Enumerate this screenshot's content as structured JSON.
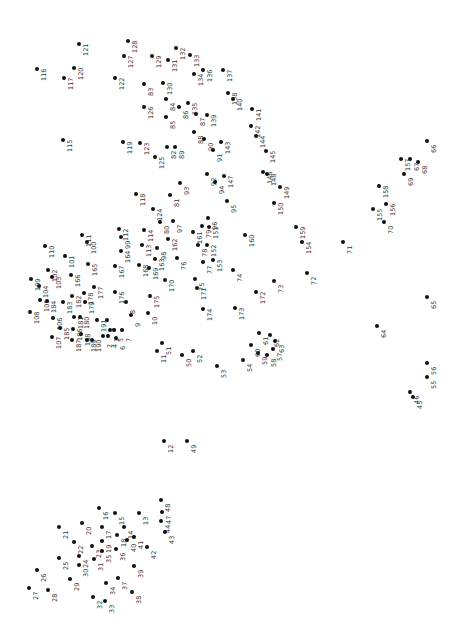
{
  "puzzle": {
    "type": "connect-the-dots",
    "orientation": "rotated-90",
    "dot_color": "#111111",
    "label_color": "#333333",
    "dots": [
      {
        "n": "1",
        "x": 110,
        "y": 330
      },
      {
        "n": "2",
        "x": 103,
        "y": 336
      },
      {
        "n": "3",
        "x": 107,
        "y": 320
      },
      {
        "n": "4",
        "x": 108,
        "y": 336
      },
      {
        "n": "5",
        "x": 114,
        "y": 330
      },
      {
        "n": "6",
        "x": 116,
        "y": 338
      },
      {
        "n": "7",
        "x": 122,
        "y": 330
      },
      {
        "n": "8",
        "x": 126,
        "y": 302
      },
      {
        "n": "9",
        "x": 131,
        "y": 315
      },
      {
        "n": "10",
        "x": 148,
        "y": 313
      },
      {
        "n": "11",
        "x": 157,
        "y": 351
      },
      {
        "n": "12",
        "x": 164,
        "y": 441
      },
      {
        "n": "13",
        "x": 139,
        "y": 513
      },
      {
        "n": "14",
        "x": 124,
        "y": 527
      },
      {
        "n": "15",
        "x": 115,
        "y": 513
      },
      {
        "n": "16",
        "x": 99,
        "y": 508
      },
      {
        "n": "17",
        "x": 102,
        "y": 527
      },
      {
        "n": "18",
        "x": 117,
        "y": 535
      },
      {
        "n": "19",
        "x": 102,
        "y": 541
      },
      {
        "n": "20",
        "x": 82,
        "y": 523
      },
      {
        "n": "21",
        "x": 59,
        "y": 527
      },
      {
        "n": "22",
        "x": 74,
        "y": 542
      },
      {
        "n": "23",
        "x": 92,
        "y": 546
      },
      {
        "n": "24",
        "x": 79,
        "y": 556
      },
      {
        "n": "25",
        "x": 59,
        "y": 558
      },
      {
        "n": "26",
        "x": 37,
        "y": 570
      },
      {
        "n": "27",
        "x": 29,
        "y": 588
      },
      {
        "n": "28",
        "x": 48,
        "y": 590
      },
      {
        "n": "29",
        "x": 70,
        "y": 579
      },
      {
        "n": "30",
        "x": 79,
        "y": 565
      },
      {
        "n": "31",
        "x": 94,
        "y": 559
      },
      {
        "n": "32",
        "x": 93,
        "y": 597
      },
      {
        "n": "33",
        "x": 105,
        "y": 601
      },
      {
        "n": "34",
        "x": 106,
        "y": 583
      },
      {
        "n": "35",
        "x": 102,
        "y": 551
      },
      {
        "n": "36",
        "x": 116,
        "y": 549
      },
      {
        "n": "37",
        "x": 118,
        "y": 578
      },
      {
        "n": "38",
        "x": 132,
        "y": 592
      },
      {
        "n": "39",
        "x": 134,
        "y": 566
      },
      {
        "n": "40",
        "x": 127,
        "y": 540
      },
      {
        "n": "41",
        "x": 134,
        "y": 537
      },
      {
        "n": "42",
        "x": 147,
        "y": 547
      },
      {
        "n": "43",
        "x": 165,
        "y": 532
      },
      {
        "n": "44",
        "x": 161,
        "y": 521
      },
      {
        "n": "45",
        "x": 413,
        "y": 397
      },
      {
        "n": "46",
        "x": 410,
        "y": 392
      },
      {
        "n": "47",
        "x": 162,
        "y": 512
      },
      {
        "n": "48",
        "x": 161,
        "y": 500
      },
      {
        "n": "49",
        "x": 187,
        "y": 441
      },
      {
        "n": "50",
        "x": 182,
        "y": 355
      },
      {
        "n": "51",
        "x": 162,
        "y": 343
      },
      {
        "n": "52",
        "x": 193,
        "y": 351
      },
      {
        "n": "53",
        "x": 217,
        "y": 366
      },
      {
        "n": "54",
        "x": 243,
        "y": 360
      },
      {
        "n": "55",
        "x": 427,
        "y": 377
      },
      {
        "n": "56",
        "x": 427,
        "y": 363
      },
      {
        "n": "57",
        "x": 273,
        "y": 349
      },
      {
        "n": "58",
        "x": 267,
        "y": 355
      },
      {
        "n": "59",
        "x": 258,
        "y": 353
      },
      {
        "n": "60",
        "x": 251,
        "y": 345
      },
      {
        "n": "61",
        "x": 259,
        "y": 333
      },
      {
        "n": "62",
        "x": 270,
        "y": 335
      },
      {
        "n": "63",
        "x": 275,
        "y": 341
      },
      {
        "n": "64",
        "x": 377,
        "y": 326
      },
      {
        "n": "65",
        "x": 427,
        "y": 297
      },
      {
        "n": "66",
        "x": 427,
        "y": 141
      },
      {
        "n": "67",
        "x": 410,
        "y": 159
      },
      {
        "n": "68",
        "x": 418,
        "y": 162
      },
      {
        "n": "69",
        "x": 404,
        "y": 174
      },
      {
        "n": "70",
        "x": 384,
        "y": 222
      },
      {
        "n": "71",
        "x": 343,
        "y": 242
      },
      {
        "n": "72",
        "x": 307,
        "y": 273
      },
      {
        "n": "73",
        "x": 274,
        "y": 281
      },
      {
        "n": "74",
        "x": 233,
        "y": 270
      },
      {
        "n": "75",
        "x": 195,
        "y": 279
      },
      {
        "n": "76",
        "x": 177,
        "y": 258
      },
      {
        "n": "77",
        "x": 203,
        "y": 262
      },
      {
        "n": "78",
        "x": 198,
        "y": 245
      },
      {
        "n": "79",
        "x": 202,
        "y": 226
      },
      {
        "n": "80",
        "x": 160,
        "y": 222
      },
      {
        "n": "81",
        "x": 170,
        "y": 195
      },
      {
        "n": "82",
        "x": 167,
        "y": 147
      },
      {
        "n": "83",
        "x": 144,
        "y": 84
      },
      {
        "n": "84",
        "x": 166,
        "y": 99
      },
      {
        "n": "85",
        "x": 166,
        "y": 117
      },
      {
        "n": "86",
        "x": 179,
        "y": 107
      },
      {
        "n": "87",
        "x": 196,
        "y": 114
      },
      {
        "n": "88",
        "x": 194,
        "y": 132
      },
      {
        "n": "89",
        "x": 175,
        "y": 147
      },
      {
        "n": "90",
        "x": 204,
        "y": 139
      },
      {
        "n": "91",
        "x": 213,
        "y": 150
      },
      {
        "n": "92",
        "x": 207,
        "y": 174
      },
      {
        "n": "93",
        "x": 180,
        "y": 183
      },
      {
        "n": "94",
        "x": 215,
        "y": 182
      },
      {
        "n": "95",
        "x": 227,
        "y": 201
      },
      {
        "n": "96",
        "x": 208,
        "y": 218
      },
      {
        "n": "97",
        "x": 173,
        "y": 221
      },
      {
        "n": "98",
        "x": 157,
        "y": 248
      },
      {
        "n": "99",
        "x": 121,
        "y": 237
      },
      {
        "n": "100",
        "x": 87,
        "y": 242
      },
      {
        "n": "101",
        "x": 65,
        "y": 256
      },
      {
        "n": "102",
        "x": 48,
        "y": 270
      },
      {
        "n": "103",
        "x": 52,
        "y": 277
      },
      {
        "n": "104",
        "x": 39,
        "y": 286
      },
      {
        "n": "105",
        "x": 40,
        "y": 300
      },
      {
        "n": "106",
        "x": 53,
        "y": 318
      },
      {
        "n": "107",
        "x": 52,
        "y": 337
      },
      {
        "n": "108",
        "x": 30,
        "y": 312
      },
      {
        "n": "109",
        "x": 31,
        "y": 279
      },
      {
        "n": "110",
        "x": 45,
        "y": 246
      },
      {
        "n": "111",
        "x": 82,
        "y": 235
      },
      {
        "n": "112",
        "x": 119,
        "y": 229
      },
      {
        "n": "113",
        "x": 142,
        "y": 245
      },
      {
        "n": "114",
        "x": 144,
        "y": 230
      },
      {
        "n": "115",
        "x": 63,
        "y": 140
      },
      {
        "n": "116",
        "x": 37,
        "y": 69
      },
      {
        "n": "117",
        "x": 64,
        "y": 78
      },
      {
        "n": "118",
        "x": 136,
        "y": 194
      },
      {
        "n": "119",
        "x": 123,
        "y": 142
      },
      {
        "n": "120",
        "x": 74,
        "y": 68
      },
      {
        "n": "121",
        "x": 79,
        "y": 44
      },
      {
        "n": "122",
        "x": 115,
        "y": 78
      },
      {
        "n": "123",
        "x": 140,
        "y": 143
      },
      {
        "n": "124",
        "x": 153,
        "y": 209
      },
      {
        "n": "125",
        "x": 155,
        "y": 157
      },
      {
        "n": "126",
        "x": 144,
        "y": 107
      },
      {
        "n": "127",
        "x": 124,
        "y": 56
      },
      {
        "n": "128",
        "x": 128,
        "y": 41
      },
      {
        "n": "129",
        "x": 152,
        "y": 56
      },
      {
        "n": "130",
        "x": 163,
        "y": 83
      },
      {
        "n": "131",
        "x": 168,
        "y": 60
      },
      {
        "n": "132",
        "x": 176,
        "y": 48
      },
      {
        "n": "133",
        "x": 190,
        "y": 55
      },
      {
        "n": "134",
        "x": 194,
        "y": 74
      },
      {
        "n": "135",
        "x": 188,
        "y": 103
      },
      {
        "n": "136",
        "x": 203,
        "y": 70
      },
      {
        "n": "137",
        "x": 223,
        "y": 70
      },
      {
        "n": "138",
        "x": 228,
        "y": 93
      },
      {
        "n": "139",
        "x": 207,
        "y": 115
      },
      {
        "n": "140",
        "x": 233,
        "y": 99
      },
      {
        "n": "141",
        "x": 252,
        "y": 109
      },
      {
        "n": "142",
        "x": 251,
        "y": 126
      },
      {
        "n": "143",
        "x": 221,
        "y": 142
      },
      {
        "n": "144",
        "x": 256,
        "y": 136
      },
      {
        "n": "145",
        "x": 266,
        "y": 151
      },
      {
        "n": "146",
        "x": 263,
        "y": 172
      },
      {
        "n": "147",
        "x": 224,
        "y": 176
      },
      {
        "n": "148",
        "x": 267,
        "y": 174
      },
      {
        "n": "149",
        "x": 280,
        "y": 187
      },
      {
        "n": "150",
        "x": 274,
        "y": 203
      },
      {
        "n": "151",
        "x": 209,
        "y": 227
      },
      {
        "n": "152",
        "x": 207,
        "y": 245
      },
      {
        "n": "153",
        "x": 213,
        "y": 260
      },
      {
        "n": "154",
        "x": 302,
        "y": 242
      },
      {
        "n": "155",
        "x": 373,
        "y": 209
      },
      {
        "n": "156",
        "x": 386,
        "y": 204
      },
      {
        "n": "157",
        "x": 401,
        "y": 159
      },
      {
        "n": "158",
        "x": 379,
        "y": 186
      },
      {
        "n": "159",
        "x": 296,
        "y": 227
      },
      {
        "n": "160",
        "x": 245,
        "y": 235
      },
      {
        "n": "161",
        "x": 193,
        "y": 232
      },
      {
        "n": "162",
        "x": 168,
        "y": 239
      },
      {
        "n": "163",
        "x": 155,
        "y": 259
      },
      {
        "n": "164",
        "x": 121,
        "y": 251
      },
      {
        "n": "165",
        "x": 88,
        "y": 264
      },
      {
        "n": "166",
        "x": 71,
        "y": 275
      },
      {
        "n": "167",
        "x": 115,
        "y": 266
      },
      {
        "n": "168",
        "x": 139,
        "y": 265
      },
      {
        "n": "169",
        "x": 149,
        "y": 268
      },
      {
        "n": "170",
        "x": 165,
        "y": 280
      },
      {
        "n": "171",
        "x": 197,
        "y": 288
      },
      {
        "n": "172",
        "x": 256,
        "y": 292
      },
      {
        "n": "173",
        "x": 235,
        "y": 308
      },
      {
        "n": "174",
        "x": 203,
        "y": 309
      },
      {
        "n": "175",
        "x": 150,
        "y": 296
      },
      {
        "n": "176",
        "x": 115,
        "y": 292
      },
      {
        "n": "177",
        "x": 94,
        "y": 287
      },
      {
        "n": "178",
        "x": 84,
        "y": 293
      },
      {
        "n": "179",
        "x": 85,
        "y": 302
      },
      {
        "n": "180",
        "x": 80,
        "y": 317
      },
      {
        "n": "181",
        "x": 74,
        "y": 317
      },
      {
        "n": "182",
        "x": 72,
        "y": 296
      },
      {
        "n": "183",
        "x": 63,
        "y": 302
      },
      {
        "n": "184",
        "x": 47,
        "y": 301
      },
      {
        "n": "185",
        "x": 60,
        "y": 328
      },
      {
        "n": "186",
        "x": 73,
        "y": 329
      },
      {
        "n": "187",
        "x": 72,
        "y": 340
      },
      {
        "n": "188",
        "x": 81,
        "y": 334
      },
      {
        "n": "189",
        "x": 87,
        "y": 340
      },
      {
        "n": "190",
        "x": 92,
        "y": 340
      },
      {
        "n": "191",
        "x": 97,
        "y": 320
      }
    ]
  }
}
